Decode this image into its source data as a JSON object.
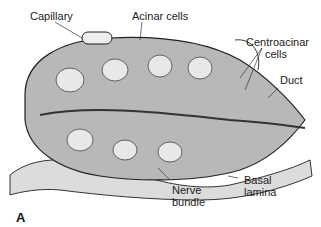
{
  "figure": {
    "panel_label": "A",
    "labels": {
      "capillary": "Capillary",
      "acinar_cells": "Acinar cells",
      "centroacinar_1": "Centroacinar",
      "centroacinar_2": "cells",
      "duct": "Duct",
      "nerve_1": "Nerve",
      "nerve_2": "bundle",
      "basal_1": "Basal",
      "basal_2": "lamina"
    },
    "colors": {
      "ink": "#222222",
      "shade": "#8a8a8a",
      "light": "#d8d8d8"
    }
  }
}
